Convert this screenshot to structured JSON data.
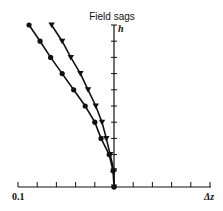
{
  "chart_data": {
    "type": "line",
    "title": "Field sags",
    "xlabel": "Δz",
    "ylabel": "h",
    "x_tick_label_left": "0.1",
    "xlim": [
      -0.1,
      0.1
    ],
    "ylim": [
      0,
      10
    ],
    "x_ticks": [
      -0.1,
      -0.08,
      -0.06,
      -0.04,
      -0.02,
      0,
      0.02,
      0.04,
      0.06,
      0.08,
      0.1
    ],
    "y_ticks": [
      0,
      1,
      2,
      3,
      4,
      5,
      6,
      7,
      8,
      9,
      10
    ],
    "grid": false,
    "legend": null,
    "h": [
      0,
      1,
      2,
      3,
      4,
      5,
      6,
      7,
      8,
      9,
      10
    ],
    "series": [
      {
        "name": "circles",
        "marker": "circle",
        "values": [
          0,
          -0.001,
          -0.005,
          -0.0135,
          -0.02,
          -0.03,
          -0.042,
          -0.054,
          -0.066,
          -0.077,
          -0.0885
        ]
      },
      {
        "name": "triangles",
        "marker": "triangle-down",
        "values": [
          0,
          0.0,
          -0.004,
          -0.008,
          -0.0125,
          -0.019,
          -0.027,
          -0.035,
          -0.045,
          -0.054,
          -0.065
        ]
      }
    ]
  },
  "style": {
    "ink": "#111111",
    "background": "#ffffff"
  }
}
